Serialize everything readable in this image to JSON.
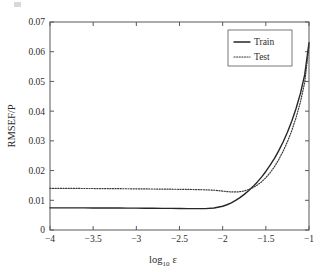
{
  "chart_data": {
    "type": "line",
    "title": "",
    "subtitle": "",
    "xlabel": "log_10 ε",
    "xlabel_base": "log",
    "xlabel_sub": "10",
    "xlabel_symbol": "ε",
    "ylabel": "RMSEF/P",
    "xlim": [
      -4,
      -1
    ],
    "ylim": [
      0,
      0.07
    ],
    "grid": false,
    "legend_position": "top-right",
    "xticks": [
      -4,
      -3.5,
      -3,
      -2.5,
      -2,
      -1.5,
      -1
    ],
    "xticklabels": [
      "−4",
      "−3.5",
      "−3",
      "−2.5",
      "−2",
      "−1.5",
      "−1"
    ],
    "yticks": [
      0,
      0.01,
      0.02,
      0.03,
      0.04,
      0.05,
      0.06,
      0.07
    ],
    "yticklabels": [
      "0",
      "0.01",
      "0.02",
      "0.03",
      "0.04",
      "0.05",
      "0.06",
      "0.07"
    ],
    "x": [
      -4.0,
      -3.9,
      -3.8,
      -3.7,
      -3.6,
      -3.5,
      -3.4,
      -3.3,
      -3.2,
      -3.1,
      -3.0,
      -2.9,
      -2.8,
      -2.7,
      -2.6,
      -2.5,
      -2.4,
      -2.3,
      -2.2,
      -2.1,
      -2.0,
      -1.95,
      -1.9,
      -1.85,
      -1.8,
      -1.75,
      -1.7,
      -1.65,
      -1.6,
      -1.55,
      -1.5,
      -1.45,
      -1.4,
      -1.35,
      -1.3,
      -1.25,
      -1.2,
      -1.15,
      -1.1,
      -1.05,
      -1.0
    ],
    "series": [
      {
        "name": "Train",
        "style": "solid",
        "color": "#262626",
        "values": [
          0.00745,
          0.00745,
          0.00744,
          0.00744,
          0.00743,
          0.00742,
          0.00741,
          0.0074,
          0.00739,
          0.00737,
          0.00735,
          0.00733,
          0.00731,
          0.00729,
          0.00727,
          0.00724,
          0.00721,
          0.00718,
          0.0072,
          0.0074,
          0.008,
          0.0085,
          0.00915,
          0.00995,
          0.0109,
          0.012,
          0.0132,
          0.0146,
          0.0161,
          0.0178,
          0.0197,
          0.0218,
          0.0241,
          0.0267,
          0.0296,
          0.0329,
          0.0366,
          0.0409,
          0.0459,
          0.0522,
          0.063
        ]
      },
      {
        "name": "Test",
        "style": "dotted",
        "color": "#3a3a3a",
        "values": [
          0.014,
          0.014,
          0.01399,
          0.01398,
          0.01397,
          0.01396,
          0.01394,
          0.01392,
          0.0139,
          0.01388,
          0.01385,
          0.01382,
          0.01379,
          0.01376,
          0.01373,
          0.0137,
          0.01366,
          0.0136,
          0.01352,
          0.0134,
          0.0131,
          0.01292,
          0.01282,
          0.0128,
          0.0129,
          0.01315,
          0.0136,
          0.01425,
          0.0151,
          0.0162,
          0.0176,
          0.0193,
          0.0213,
          0.0237,
          0.0265,
          0.0297,
          0.0334,
          0.0378,
          0.043,
          0.0496,
          0.062
        ]
      }
    ]
  },
  "legend": {
    "entries": [
      {
        "label": "Train",
        "style": "solid"
      },
      {
        "label": "Test",
        "style": "dotted"
      }
    ]
  }
}
